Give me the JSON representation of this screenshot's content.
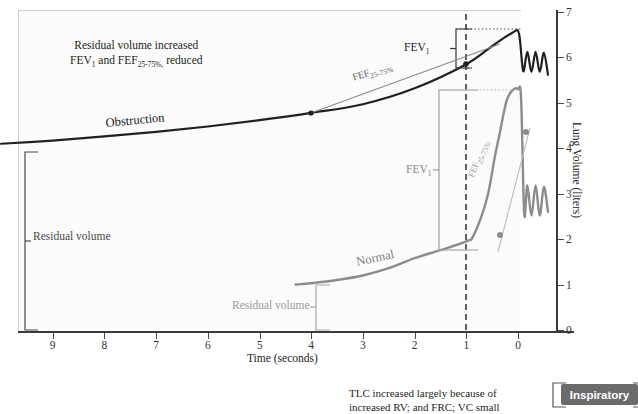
{
  "chart_data": {
    "type": "line",
    "xlabel": "Time (seconds)",
    "ylabel": "Lung Volume (liters)",
    "xlim": [
      10,
      -0.6
    ],
    "ylim": [
      0,
      7
    ],
    "x_ticks": [
      9,
      8,
      7,
      6,
      5,
      4,
      3,
      2,
      1,
      0
    ],
    "y_ticks": [
      0,
      1,
      2,
      3,
      4,
      5,
      6,
      7
    ],
    "x_axis_inverted": true,
    "grid": false,
    "legend": "none",
    "series": [
      {
        "name": "Obstruction",
        "color": "#231f20",
        "residual_volume": 4.1,
        "fev1_volume": 5.85,
        "peak_volume": 6.55,
        "fef_25_75_start": [
          4.0,
          4.78
        ],
        "fef_25_75_end": [
          1.0,
          5.85
        ],
        "points": [
          [
            10.0,
            4.1
          ],
          [
            9.0,
            4.17
          ],
          [
            8.0,
            4.26
          ],
          [
            7.0,
            4.36
          ],
          [
            6.0,
            4.48
          ],
          [
            5.0,
            4.62
          ],
          [
            4.0,
            4.78
          ],
          [
            3.0,
            4.97
          ],
          [
            2.0,
            5.32
          ],
          [
            1.0,
            5.85
          ],
          [
            0.5,
            6.25
          ],
          [
            0.1,
            6.55
          ],
          [
            -0.02,
            6.52
          ],
          [
            -0.1,
            5.7
          ],
          [
            -0.18,
            6.12
          ],
          [
            -0.26,
            5.68
          ],
          [
            -0.34,
            6.12
          ],
          [
            -0.42,
            5.68
          ],
          [
            -0.5,
            6.1
          ],
          [
            -0.58,
            5.62
          ]
        ]
      },
      {
        "name": "Normal",
        "color": "#8c8c8c",
        "residual_volume": 1.0,
        "fev1_volume": 5.3,
        "peak_volume": 5.3,
        "fef_25_75_start": [
          0.85,
          2.1
        ],
        "fef_25_75_end": [
          0.35,
          4.35
        ],
        "points": [
          [
            4.3,
            1.0
          ],
          [
            4.0,
            1.03
          ],
          [
            3.5,
            1.1
          ],
          [
            3.0,
            1.2
          ],
          [
            2.5,
            1.36
          ],
          [
            2.0,
            1.58
          ],
          [
            1.5,
            1.76
          ],
          [
            1.0,
            1.95
          ],
          [
            0.85,
            2.1
          ],
          [
            0.6,
            2.9
          ],
          [
            0.45,
            3.8
          ],
          [
            0.35,
            4.35
          ],
          [
            0.22,
            5.05
          ],
          [
            0.1,
            5.28
          ],
          [
            0.0,
            5.3
          ],
          [
            -0.06,
            5.1
          ],
          [
            -0.12,
            2.55
          ],
          [
            -0.18,
            3.18
          ],
          [
            -0.26,
            2.52
          ],
          [
            -0.34,
            3.18
          ],
          [
            -0.42,
            2.52
          ],
          [
            -0.5,
            3.15
          ],
          [
            -0.58,
            2.6
          ]
        ]
      }
    ],
    "annotations": {
      "note_line1": "Residual volume increased",
      "note_line2_pre": "FEV",
      "note_line2_sub1": "1",
      "note_line2_mid": " and FEF",
      "note_line2_sub2": "25-75%,",
      "note_line2_post": " reduced",
      "obstruction_label": "Obstruction",
      "normal_label": "Normal",
      "fev1_label": "FEV",
      "fev1_sub": "1",
      "fef_label": "FEF",
      "fef_sub": "25-75%",
      "residual_volume_label": "Residual volume"
    }
  },
  "caption": {
    "line1": "TLC increased largely because of",
    "line2": "increased RV; and FRC; VC small"
  },
  "inspiratory_box": {
    "label": "Inspiratory",
    "color": "#6b6b6b"
  },
  "axes": {
    "x_title": "Time (seconds)",
    "y_title": "Lung Volume (liters)",
    "x_tick_labels": [
      "9",
      "8",
      "7",
      "6",
      "5",
      "4",
      "3",
      "2",
      "1",
      "0"
    ],
    "y_tick_labels": [
      "0",
      "1",
      "2",
      "3",
      "4",
      "5",
      "6",
      "7"
    ]
  },
  "colors": {
    "obstruction": "#231f20",
    "normal": "#8c8c8c",
    "accent_gray": "#6b6b6b",
    "axis": "#3a3a3a"
  }
}
